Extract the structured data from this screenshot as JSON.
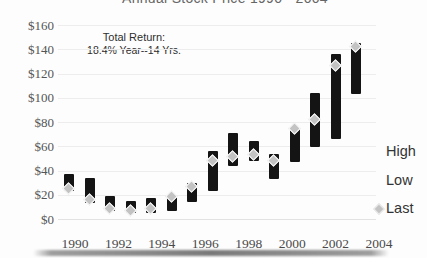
{
  "header": {
    "title": "Annual Stock Price 1990 - 2004"
  },
  "annotation": {
    "line1": "Total Return:",
    "line2": "18.4% Year--14 Yrs."
  },
  "legend": {
    "items": [
      {
        "label": "High",
        "marker": "none"
      },
      {
        "label": "Low",
        "marker": "none"
      },
      {
        "label": "Last",
        "marker": "gray-diamond"
      }
    ]
  },
  "colors": {
    "bar": "#141414",
    "last_marker_fill": "#c3c3c3",
    "last_marker_border": "#ffffff",
    "gridline": "#ededed",
    "tick_text": "#555555"
  },
  "y_axis": {
    "min": 0,
    "max": 160,
    "step": 20,
    "tick_labels": [
      "$0",
      "$20",
      "$40",
      "$60",
      "$80",
      "$100",
      "$120",
      "$140",
      "$160"
    ]
  },
  "x_axis": {
    "tick_labels": [
      "1990",
      "1992",
      "1994",
      "1996",
      "1998",
      "2000",
      "2002",
      "2004"
    ]
  },
  "chart_data": {
    "type": "bar",
    "subtype": "high-low-range with last marker",
    "title": "Annual Stock Price 1990 - 2004",
    "annotation": "Total Return: 18.4% Year--14 Yrs.",
    "categories": [
      1990,
      1991,
      1992,
      1993,
      1994,
      1995,
      1996,
      1997,
      1998,
      1999,
      2000,
      2001,
      2002,
      2003,
      2004
    ],
    "series": [
      {
        "name": "High",
        "values": [
          37,
          34,
          19,
          15,
          17,
          20,
          30,
          56,
          71,
          64,
          54,
          75,
          104,
          136,
          145
        ]
      },
      {
        "name": "Low",
        "values": [
          23,
          13,
          7,
          5,
          5,
          7,
          14,
          23,
          44,
          48,
          33,
          47,
          59,
          66,
          103
        ]
      },
      {
        "name": "Last",
        "values": [
          25,
          16,
          8,
          7,
          8,
          18,
          26,
          48,
          51,
          53,
          48,
          74,
          82,
          126,
          142
        ]
      }
    ],
    "ylim": [
      0,
      160
    ],
    "y_tick_step": 20,
    "x_tick_labels_shown": [
      "1990",
      "1992",
      "1994",
      "1996",
      "1998",
      "2000",
      "2002",
      "2004"
    ],
    "legend_position": "right",
    "grid": "faint horizontal lines at $20 intervals"
  }
}
